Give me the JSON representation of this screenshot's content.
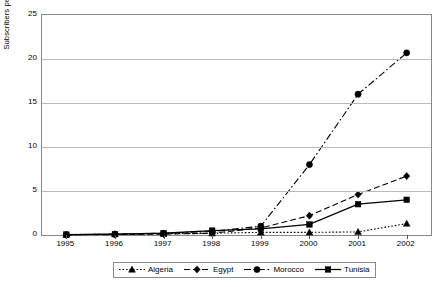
{
  "chart_data": {
    "type": "line",
    "title": "",
    "xlabel": "",
    "ylabel": "Subscribers per 100 Inhabitants",
    "categories": [
      "1995",
      "1996",
      "1997",
      "1998",
      "1999",
      "2000",
      "2001",
      "2002"
    ],
    "ylim": [
      0,
      25
    ],
    "yticks": [
      0,
      5,
      10,
      15,
      20,
      25
    ],
    "ytick_labels": [
      "0",
      "5",
      "10",
      "15",
      "20",
      "25"
    ],
    "grid": true,
    "legend_position": "bottom",
    "series": [
      {
        "name": "Algeria",
        "marker": "triangle",
        "line_style": "dotted",
        "color": "#000000",
        "values": [
          0.05,
          0.1,
          0.15,
          0.2,
          0.3,
          0.3,
          0.35,
          1.3
        ]
      },
      {
        "name": "Egypt",
        "marker": "diamond",
        "line_style": "dashed",
        "color": "#000000",
        "values": [
          0.01,
          0.05,
          0.1,
          0.2,
          0.8,
          2.2,
          4.6,
          6.7
        ]
      },
      {
        "name": "Morocco",
        "marker": "circle",
        "line_style": "dash-dot",
        "color": "#000000",
        "values": [
          0.02,
          0.1,
          0.2,
          0.4,
          1.0,
          8.0,
          16.0,
          20.7
        ]
      },
      {
        "name": "Tunisia",
        "marker": "square",
        "line_style": "solid",
        "color": "#000000",
        "values": [
          0.05,
          0.1,
          0.2,
          0.5,
          0.7,
          1.2,
          3.5,
          4.0
        ]
      }
    ]
  },
  "axis": {
    "y_label_text": "Subscribers per 100 Inhabitants"
  }
}
